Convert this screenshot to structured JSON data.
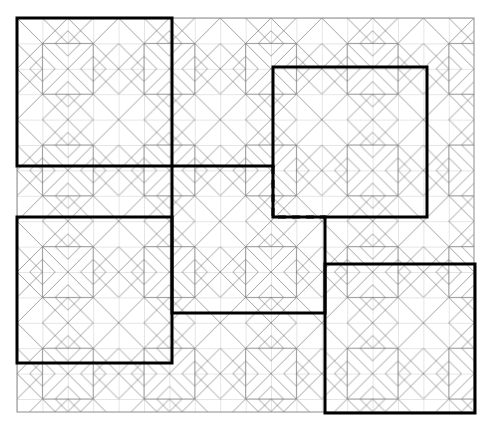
{
  "figure": {
    "type": "diagram",
    "canvas": {
      "width": 497,
      "height": 428,
      "background": "#ffffff"
    }
  },
  "style": {
    "thin_line_color": "#9a9a9a",
    "motif_line_color": "#777777",
    "thick_line_color": "#000000",
    "outer_border_color": "#8c8c8c",
    "thin_line_width": 0.7,
    "motif_line_width": 0.7,
    "thick_line_width": 3,
    "dashed_pattern": "8 6"
  },
  "grid": {
    "origin_x": 17,
    "origin_y": 18,
    "cell": 25.4,
    "cols": 18,
    "rows": 15.5,
    "motif_block": 50.8,
    "note": "thin grey square grid covering the tiled area"
  },
  "outer_border": {
    "x": 17,
    "y": 18,
    "width": 457,
    "height": 394
  },
  "tiled_region": {
    "x": 17,
    "y": 18,
    "width": 457,
    "height": 394,
    "motif_name": "star-diamond-block",
    "motif_size": 101.6,
    "cols": 4.5,
    "rows": 3.9
  },
  "thick_shapes": [
    {
      "name": "block-top-left",
      "kind": "square",
      "x": 17,
      "y": 18,
      "width": 155,
      "height": 148
    },
    {
      "name": "block-top-right",
      "kind": "square",
      "x": 273,
      "y": 67,
      "width": 154,
      "height": 150
    },
    {
      "name": "block-bottom-left",
      "kind": "square",
      "x": 17,
      "y": 217,
      "width": 155,
      "height": 146
    },
    {
      "name": "block-bottom-right",
      "kind": "square",
      "x": 325,
      "y": 264,
      "width": 150,
      "height": 149
    }
  ],
  "center_shape": {
    "name": "block-center-notched",
    "kind": "notched-square",
    "x": 172,
    "y": 166,
    "width": 153,
    "height": 147,
    "solid_path": "M 172 166 L 325 166 L 325 313 L 172 313 Z",
    "dashed_segments": [
      {
        "name": "dashed-vertical",
        "x1": 273,
        "y1": 166,
        "x2": 273,
        "y2": 217
      },
      {
        "name": "dashed-horizontal",
        "x1": 273,
        "y1": 217,
        "x2": 325,
        "y2": 217
      }
    ],
    "note": "upper-right quadrant boundary drawn dashed where it overlaps the top-right block"
  },
  "labels": {
    "caption": ""
  }
}
